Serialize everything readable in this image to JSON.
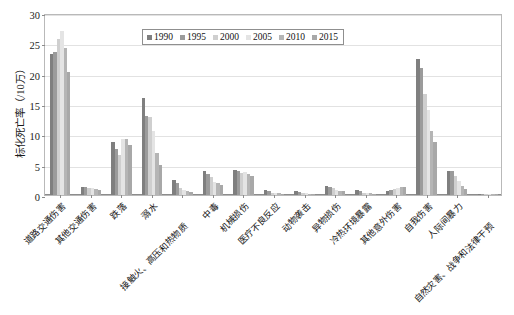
{
  "chart_data": {
    "type": "bar",
    "title": "",
    "xlabel": "",
    "ylabel": "标化死亡率（/10万）",
    "ylim": [
      0,
      30
    ],
    "yticks": [
      0,
      5,
      10,
      15,
      20,
      25,
      30
    ],
    "grid": true,
    "legend_position": "top-center",
    "categories": [
      "道路交通伤害",
      "其他交通伤害",
      "跌落",
      "溺水",
      "接触火、高压和热物质",
      "中毒",
      "机械损伤",
      "医疗不良反应",
      "动物袭击",
      "异物损伤",
      "冷热环境暴露",
      "其他意外伤害",
      "自我伤害",
      "人际间暴力",
      "自然灾害、战争和法律干预"
    ],
    "series": [
      {
        "name": "1990",
        "color": "#7f7f7f",
        "values": [
          23.2,
          1.3,
          8.7,
          16.0,
          2.5,
          4.0,
          4.1,
          0.8,
          0.7,
          1.5,
          0.8,
          0.7,
          22.4,
          4.0,
          0.2
        ]
      },
      {
        "name": "1995",
        "color": "#9b9b9b",
        "values": [
          23.6,
          1.4,
          7.6,
          13.1,
          2.0,
          3.4,
          3.9,
          0.6,
          0.5,
          1.4,
          0.6,
          0.8,
          20.9,
          3.9,
          0.2
        ]
      },
      {
        "name": "2000",
        "color": "#cfcfcf",
        "values": [
          25.7,
          1.2,
          6.6,
          12.9,
          1.2,
          2.9,
          3.7,
          0.4,
          0.4,
          1.1,
          0.4,
          1.0,
          16.6,
          3.1,
          0.2
        ]
      },
      {
        "name": "2005",
        "color": "#e4e4e4",
        "values": [
          27.1,
          1.1,
          9.2,
          10.5,
          0.9,
          2.2,
          3.8,
          0.3,
          0.3,
          0.9,
          0.3,
          1.2,
          14.0,
          2.3,
          0.1
        ]
      },
      {
        "name": "2010",
        "color": "#b5b5b5",
        "values": [
          24.3,
          1.0,
          9.2,
          7.0,
          0.7,
          1.9,
          3.5,
          0.3,
          0.2,
          0.7,
          0.3,
          1.3,
          10.6,
          1.5,
          0.1
        ]
      },
      {
        "name": "2015",
        "color": "#a8a8a8",
        "values": [
          20.3,
          0.9,
          8.3,
          5.0,
          0.5,
          1.6,
          3.2,
          0.2,
          0.2,
          0.6,
          0.2,
          1.4,
          8.7,
          1.0,
          0.1
        ]
      }
    ]
  }
}
